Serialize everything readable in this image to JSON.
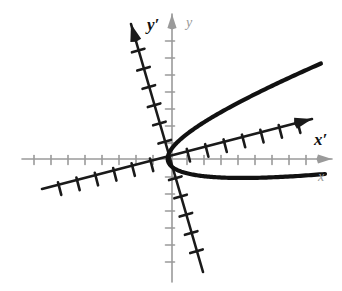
{
  "figure": {
    "background_color": "#ffffff",
    "width": 342,
    "height": 291
  },
  "chart_data": {
    "type": "line",
    "title": "",
    "subtitle": "",
    "xlabel": "x",
    "ylabel": "y",
    "grid": false,
    "legend_position": "none",
    "origin": {
      "x": 170,
      "y": 160
    },
    "rotation_degrees": 14.5,
    "axes": [
      {
        "name": "x",
        "label": "x",
        "color": "#9a9a9a",
        "style": "original",
        "arrow": true,
        "start": {
          "x": 22,
          "y": 159
        },
        "end": {
          "x": 332,
          "y": 159
        },
        "tick_spacing": 17,
        "tick_length": 9,
        "label_position": {
          "x": 318,
          "y": 178
        }
      },
      {
        "name": "y",
        "label": "y",
        "color": "#9a9a9a",
        "style": "original",
        "arrow": true,
        "start": {
          "x": 172,
          "y": 282
        },
        "end": {
          "x": 172,
          "y": 14
        },
        "tick_spacing": 17,
        "tick_length": 9,
        "label_position": {
          "x": 186,
          "y": 24
        }
      },
      {
        "name": "x-prime",
        "label": "x′",
        "color": "#1a1a1a",
        "style": "rotated",
        "arrow": true,
        "start": {
          "x": 42,
          "y": 189
        },
        "end": {
          "x": 312,
          "y": 119
        },
        "tick_spacing": 19,
        "tick_length": 13,
        "label_position": {
          "x": 314,
          "y": 141
        }
      },
      {
        "name": "y-prime",
        "label": "y′",
        "color": "#1a1a1a",
        "style": "rotated",
        "arrow": true,
        "start": {
          "x": 203,
          "y": 272
        },
        "end": {
          "x": 131,
          "y": 24
        },
        "tick_spacing": 19,
        "tick_length": 13,
        "label_position": {
          "x": 147,
          "y": 26
        }
      }
    ],
    "curve": {
      "name": "parabola",
      "color": "#111111",
      "stroke_width": 4.2,
      "opens": "right-along-x-prime",
      "vertex": {
        "x": 168,
        "y": 161
      },
      "focal_parameter": 0.055,
      "t_range": [
        -56,
        52
      ],
      "upper_branch_end": {
        "x": 273,
        "y": 51
      },
      "lower_branch_end": {
        "x": 317,
        "y": 204
      }
    },
    "annotations": []
  },
  "labels": {
    "y_prime": "y′",
    "y": "y",
    "x_prime": "x′",
    "x": "x"
  },
  "colors": {
    "primary_axis": "#1a1a1a",
    "secondary_axis": "#9a9a9a",
    "curve": "#111111",
    "background": "#ffffff"
  }
}
